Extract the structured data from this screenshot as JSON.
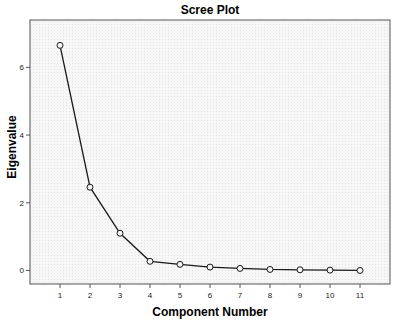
{
  "chart_data": {
    "type": "line",
    "title": "Scree Plot",
    "xlabel": "Component Number",
    "ylabel": "Eigenvalue",
    "x": [
      1,
      2,
      3,
      4,
      5,
      6,
      7,
      8,
      9,
      10,
      11
    ],
    "values": [
      6.65,
      2.46,
      1.1,
      0.27,
      0.18,
      0.1,
      0.06,
      0.03,
      0.02,
      0.01,
      0.0
    ],
    "series": [
      {
        "name": "Eigenvalue",
        "values": [
          6.65,
          2.46,
          1.1,
          0.27,
          0.18,
          0.1,
          0.06,
          0.03,
          0.02,
          0.01,
          0.0
        ]
      }
    ],
    "x_ticks": [
      "1",
      "2",
      "3",
      "4",
      "5",
      "6",
      "7",
      "8",
      "9",
      "10",
      "11"
    ],
    "y_ticks": [
      "0",
      "2",
      "4",
      "6"
    ],
    "xlim": [
      0,
      12
    ],
    "ylim": [
      -0.4,
      7.4
    ],
    "grid": false,
    "legend": null,
    "marker": "open-circle",
    "colors": {
      "line": "#1a1a1a",
      "plot_background": "#f4f4f4",
      "frame": "#555555"
    }
  }
}
